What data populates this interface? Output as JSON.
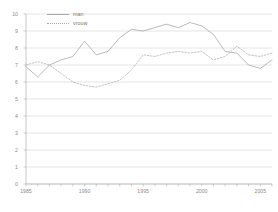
{
  "chart_data": {
    "type": "line",
    "title": "",
    "subtitle": "",
    "xlabel": "",
    "ylabel": "",
    "xlim": [
      1985,
      2006
    ],
    "ylim": [
      0,
      10
    ],
    "grid": true,
    "legend_position": "top-left",
    "x": [
      1985,
      1986,
      1987,
      1988,
      1989,
      1990,
      1991,
      1992,
      1993,
      1994,
      1995,
      1996,
      1997,
      1998,
      1999,
      2000,
      2001,
      2002,
      2003,
      2004,
      2005,
      2006
    ],
    "series": [
      {
        "name": "man",
        "style": "solid",
        "color": "#a8a8a8",
        "values": [
          6.9,
          6.3,
          7.0,
          7.3,
          7.5,
          8.4,
          7.6,
          7.8,
          8.6,
          9.1,
          9.0,
          9.2,
          9.4,
          9.2,
          9.5,
          9.3,
          8.8,
          7.8,
          7.7,
          7.0,
          6.8,
          7.3
        ]
      },
      {
        "name": "vrouw",
        "style": "dotted",
        "color": "#b4b4b4",
        "values": [
          7.0,
          7.2,
          7.0,
          6.5,
          6.0,
          5.8,
          5.7,
          5.9,
          6.1,
          6.7,
          7.6,
          7.5,
          7.7,
          7.8,
          7.7,
          7.8,
          7.3,
          7.5,
          8.1,
          7.6,
          7.5,
          7.7
        ]
      }
    ],
    "y_ticks": [
      0,
      1,
      2,
      3,
      4,
      5,
      6,
      7,
      8,
      9,
      10
    ],
    "y_tick_labels": [
      "0",
      "1",
      "2",
      "3",
      "4",
      "5",
      "6",
      "7",
      "8",
      "9",
      "10"
    ],
    "x_ticks": [
      1985,
      1990,
      1995,
      2000,
      2005
    ],
    "x_tick_labels": [
      "1985",
      "1990",
      "1995",
      "2000",
      "2005"
    ],
    "axis_color": "#b0b0b0",
    "grid_color": "#c9c9c9",
    "tick_label_color": "#8c8c8c"
  },
  "legend": {
    "items": [
      {
        "label": "man"
      },
      {
        "label": "vrouw"
      }
    ]
  }
}
